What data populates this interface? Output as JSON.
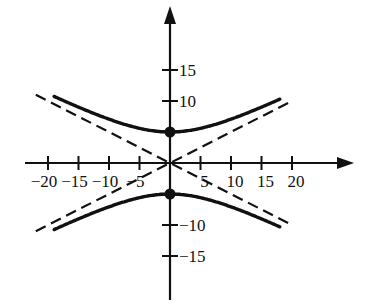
{
  "chart_data": {
    "type": "line",
    "title": "",
    "xlabel": "",
    "ylabel": "",
    "xlim": [
      -22,
      25
    ],
    "ylim": [
      -22,
      26
    ],
    "grid": false,
    "legend": null,
    "x_ticks": [
      -20,
      -15,
      -10,
      -5,
      5,
      10,
      15,
      20
    ],
    "x_tick_labels": [
      "−20",
      "−15",
      "−10",
      "−5",
      "5",
      "10",
      "15",
      "20"
    ],
    "y_ticks": [
      15,
      10,
      -10,
      -15
    ],
    "y_tick_labels": [
      "15",
      "10",
      "−10",
      "−15"
    ],
    "series": [
      {
        "name": "upper branch",
        "style": "solid",
        "equation": "y = 5*sqrt(1 + x^2/100)",
        "x_range": [
          -19,
          18
        ]
      },
      {
        "name": "lower branch",
        "style": "solid",
        "equation": "y = -5*sqrt(1 + x^2/100)",
        "x_range": [
          -19,
          18
        ]
      },
      {
        "name": "asymptote 1",
        "style": "dashed",
        "equation": "y = x/2",
        "x_range": [
          -22,
          20
        ]
      },
      {
        "name": "asymptote 2",
        "style": "dashed",
        "equation": "y = -x/2",
        "x_range": [
          -22,
          20
        ]
      }
    ],
    "points": [
      {
        "label": "vertex-top",
        "x": 0,
        "y": 5
      },
      {
        "label": "vertex-bottom",
        "x": 0,
        "y": -5
      }
    ]
  },
  "colors": {
    "ink": "#111111",
    "background": "#ffffff"
  }
}
